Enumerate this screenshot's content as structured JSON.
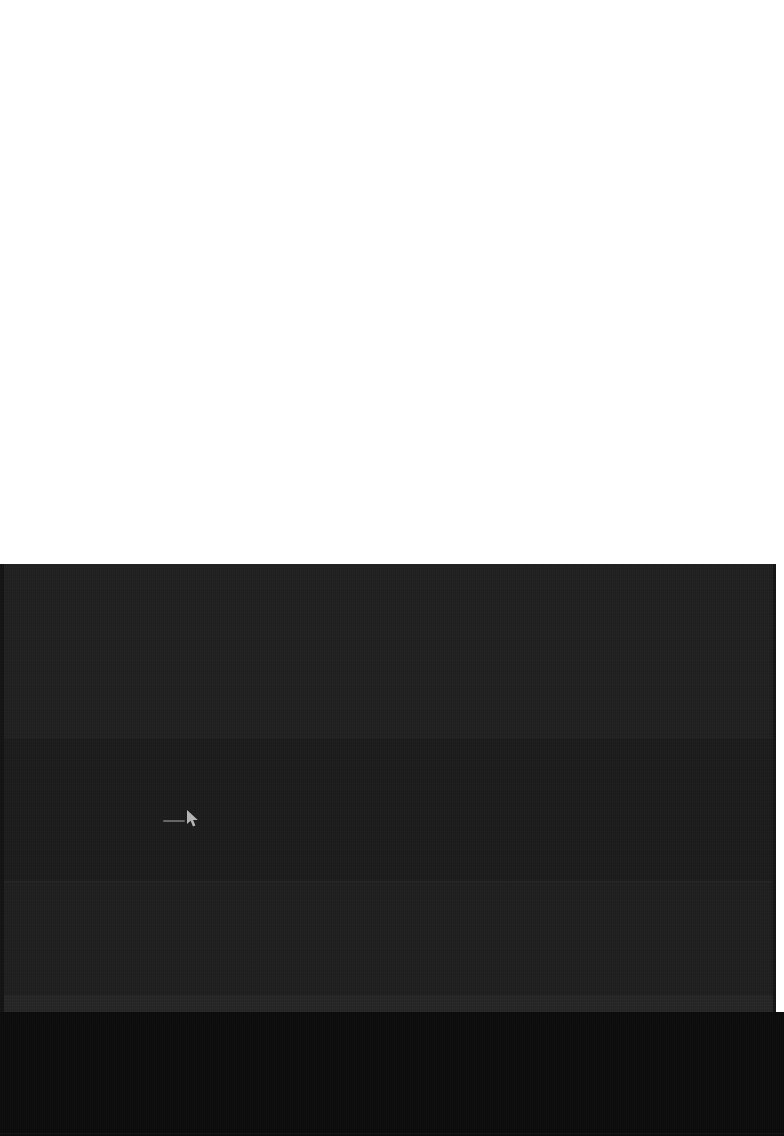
{
  "screen": {
    "width": 784,
    "height": 1136,
    "background_color": "#ffffff",
    "description": "Mostly blank white page with a large near-black content viewport occupying the lower half."
  },
  "blank_area": {
    "label": "",
    "background_color": "#ffffff",
    "region": "top"
  },
  "dark_panel": {
    "label": "",
    "background_color": "#1e1d1d",
    "bands": [
      {
        "name": "band-upper",
        "color": "#201f1f"
      },
      {
        "name": "band-middle-upper",
        "color": "#1c1b1b"
      },
      {
        "name": "band-middle-lower",
        "color": "#1f1e1e"
      },
      {
        "name": "band-lower",
        "color": "#262525"
      }
    ],
    "divider_color": "#2b2a2a",
    "left_gutter_color": "#131212",
    "right_edge_color": "#151414"
  },
  "bottom_band": {
    "label": "",
    "background_color": "#0d0c0c",
    "hairline_color": "#262525"
  },
  "cursor": {
    "icon": "mouse-pointer-icon",
    "x": 190,
    "y": 815,
    "color": "#e8e8e8"
  }
}
